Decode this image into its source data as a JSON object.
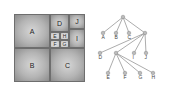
{
  "treemap": {
    "cells": [
      {
        "label": "A",
        "x": 0,
        "y": 0,
        "w": 36,
        "h": 34
      },
      {
        "label": "B",
        "x": 0,
        "y": 34,
        "w": 36,
        "h": 34
      },
      {
        "label": "C",
        "x": 36,
        "y": 34,
        "w": 35,
        "h": 34
      },
      {
        "label": "D",
        "x": 36,
        "y": 0,
        "w": 19,
        "h": 18
      },
      {
        "label": "J",
        "x": 55,
        "y": 0,
        "w": 16,
        "h": 15
      },
      {
        "label": "I",
        "x": 55,
        "y": 15,
        "w": 16,
        "h": 19
      },
      {
        "label": "E",
        "x": 36,
        "y": 18,
        "w": 10,
        "h": 8
      },
      {
        "label": "H",
        "x": 46,
        "y": 18,
        "w": 9,
        "h": 8
      },
      {
        "label": "F",
        "x": 36,
        "y": 26,
        "w": 10,
        "h": 8
      },
      {
        "label": "G",
        "x": 46,
        "y": 26,
        "w": 9,
        "h": 8
      }
    ]
  },
  "tree": {
    "root": {
      "x": 123,
      "y": 17
    },
    "level1": [
      {
        "label": "A",
        "x": 103,
        "y": 33
      },
      {
        "label": "B",
        "x": 116,
        "y": 33
      },
      {
        "label": "C",
        "x": 129,
        "y": 33
      },
      {
        "label": "",
        "x": 145,
        "y": 33
      }
    ],
    "level2": [
      {
        "label": "D",
        "x": 100,
        "y": 53
      },
      {
        "label": "",
        "x": 116,
        "y": 53
      },
      {
        "label": "I",
        "x": 134,
        "y": 53
      },
      {
        "label": "J",
        "x": 146,
        "y": 53
      }
    ],
    "level3": [
      {
        "label": "E",
        "x": 108,
        "y": 73
      },
      {
        "label": "F",
        "x": 125,
        "y": 73
      },
      {
        "label": "G",
        "x": 140,
        "y": 73
      },
      {
        "label": "H",
        "x": 153,
        "y": 73
      }
    ]
  }
}
